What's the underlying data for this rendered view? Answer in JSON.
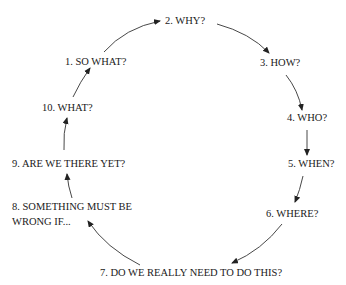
{
  "diagram": {
    "type": "cycle",
    "nodes": [
      {
        "id": 1,
        "label": "1. SO WHAT?"
      },
      {
        "id": 2,
        "label": "2. WHY?"
      },
      {
        "id": 3,
        "label": "3. HOW?"
      },
      {
        "id": 4,
        "label": "4. WHO?"
      },
      {
        "id": 5,
        "label": "5. WHEN?"
      },
      {
        "id": 6,
        "label": "6. WHERE?"
      },
      {
        "id": 7,
        "label": "7. DO WE REALLY NEED TO DO THIS?"
      },
      {
        "id": 8,
        "label_line1": "8. SOMETHING MUST BE",
        "label_line2": "WRONG IF..."
      },
      {
        "id": 9,
        "label": "9. ARE WE THERE YET?"
      },
      {
        "id": 10,
        "label": "10. WHAT?"
      }
    ],
    "edges": [
      {
        "from": 1,
        "to": 2
      },
      {
        "from": 2,
        "to": 3
      },
      {
        "from": 3,
        "to": 4
      },
      {
        "from": 4,
        "to": 5
      },
      {
        "from": 5,
        "to": 6
      },
      {
        "from": 6,
        "to": 7
      },
      {
        "from": 7,
        "to": 8
      },
      {
        "from": 8,
        "to": 9
      },
      {
        "from": 9,
        "to": 10
      },
      {
        "from": 10,
        "to": 1
      }
    ],
    "colors": {
      "text": "#1a1a1a",
      "arrow": "#333333",
      "background": "#ffffff"
    }
  }
}
